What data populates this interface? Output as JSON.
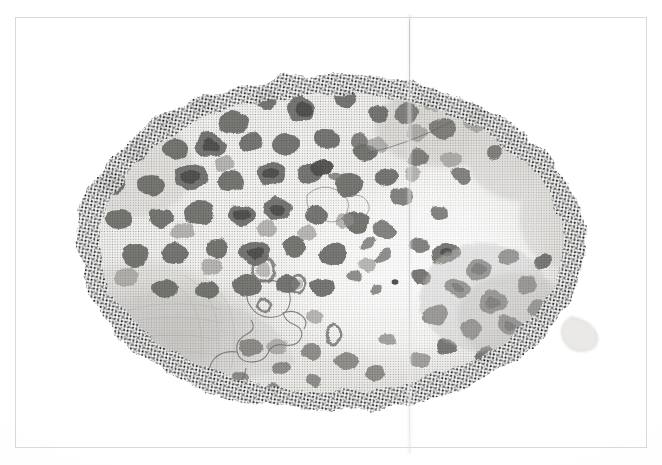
{
  "document": {
    "kind": "printed-plate-scan",
    "page_background": "#ffffff",
    "frame": {
      "present": true,
      "color": "#d9d9da",
      "x": 15,
      "y": 17,
      "width": 632,
      "height": 431
    },
    "fold_line": {
      "present": true,
      "orientation": "vertical",
      "x": 409,
      "color": "#a8a8aa"
    },
    "caption": "",
    "plate_number": "",
    "figure_label": ""
  },
  "illustration": {
    "name": "oval-mottled-specimen",
    "description": "Oval halftone micrograph of a mottled specimen with numerous dark rounded spots",
    "technique": "halftone-screen-print",
    "shape": "oval",
    "center": {
      "x": 331,
      "y": 243
    },
    "radius_x": 258,
    "radius_y": 173,
    "palette": {
      "paper": "#ffffff",
      "body_light": "#f2f1ee",
      "body_mid": "#dcdad5",
      "body_shadow": "#c2bfb8",
      "spot_mid": "#8f8d88",
      "spot_dark": "#4a4846",
      "spot_darkest": "#262524",
      "rim_stipple": "#3f3e3c",
      "outline_curve": "#5c5a57"
    },
    "regions": [
      {
        "name": "dense-spot-field",
        "side": "left",
        "note": "crowded dark rounded blotches"
      },
      {
        "name": "pale-clearing",
        "side": "center-right",
        "note": "lighter area with few spots"
      },
      {
        "name": "lower-left-shadow",
        "side": "lower-left",
        "note": "broad soft gray shading"
      },
      {
        "name": "lower-right-cluster",
        "side": "lower-right",
        "note": "secondary dark spot cluster"
      },
      {
        "name": "rim-stipple",
        "side": "perimeter",
        "note": "coarse halftone dots along margin"
      }
    ],
    "outline_curve": {
      "present": true,
      "note": "thin meandering contour line in lower-left-center"
    },
    "spot_count_approx": 120
  }
}
